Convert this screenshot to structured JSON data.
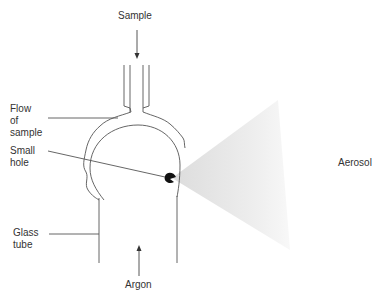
{
  "diagram": {
    "labels": {
      "sample": "Sample",
      "flow_of_sample_line1": "Flow",
      "flow_of_sample_line2": "of",
      "flow_of_sample_line3": "sample",
      "small_hole_line1": "Small",
      "small_hole_line2": "hole",
      "glass_tube_line1": "Glass",
      "glass_tube_line2": "tube",
      "argon": "Argon",
      "aerosol": "Aerosol"
    },
    "colors": {
      "line": "#444444",
      "text": "#333333",
      "aerosol": "#e4e4e4",
      "hole": "#111111"
    }
  }
}
